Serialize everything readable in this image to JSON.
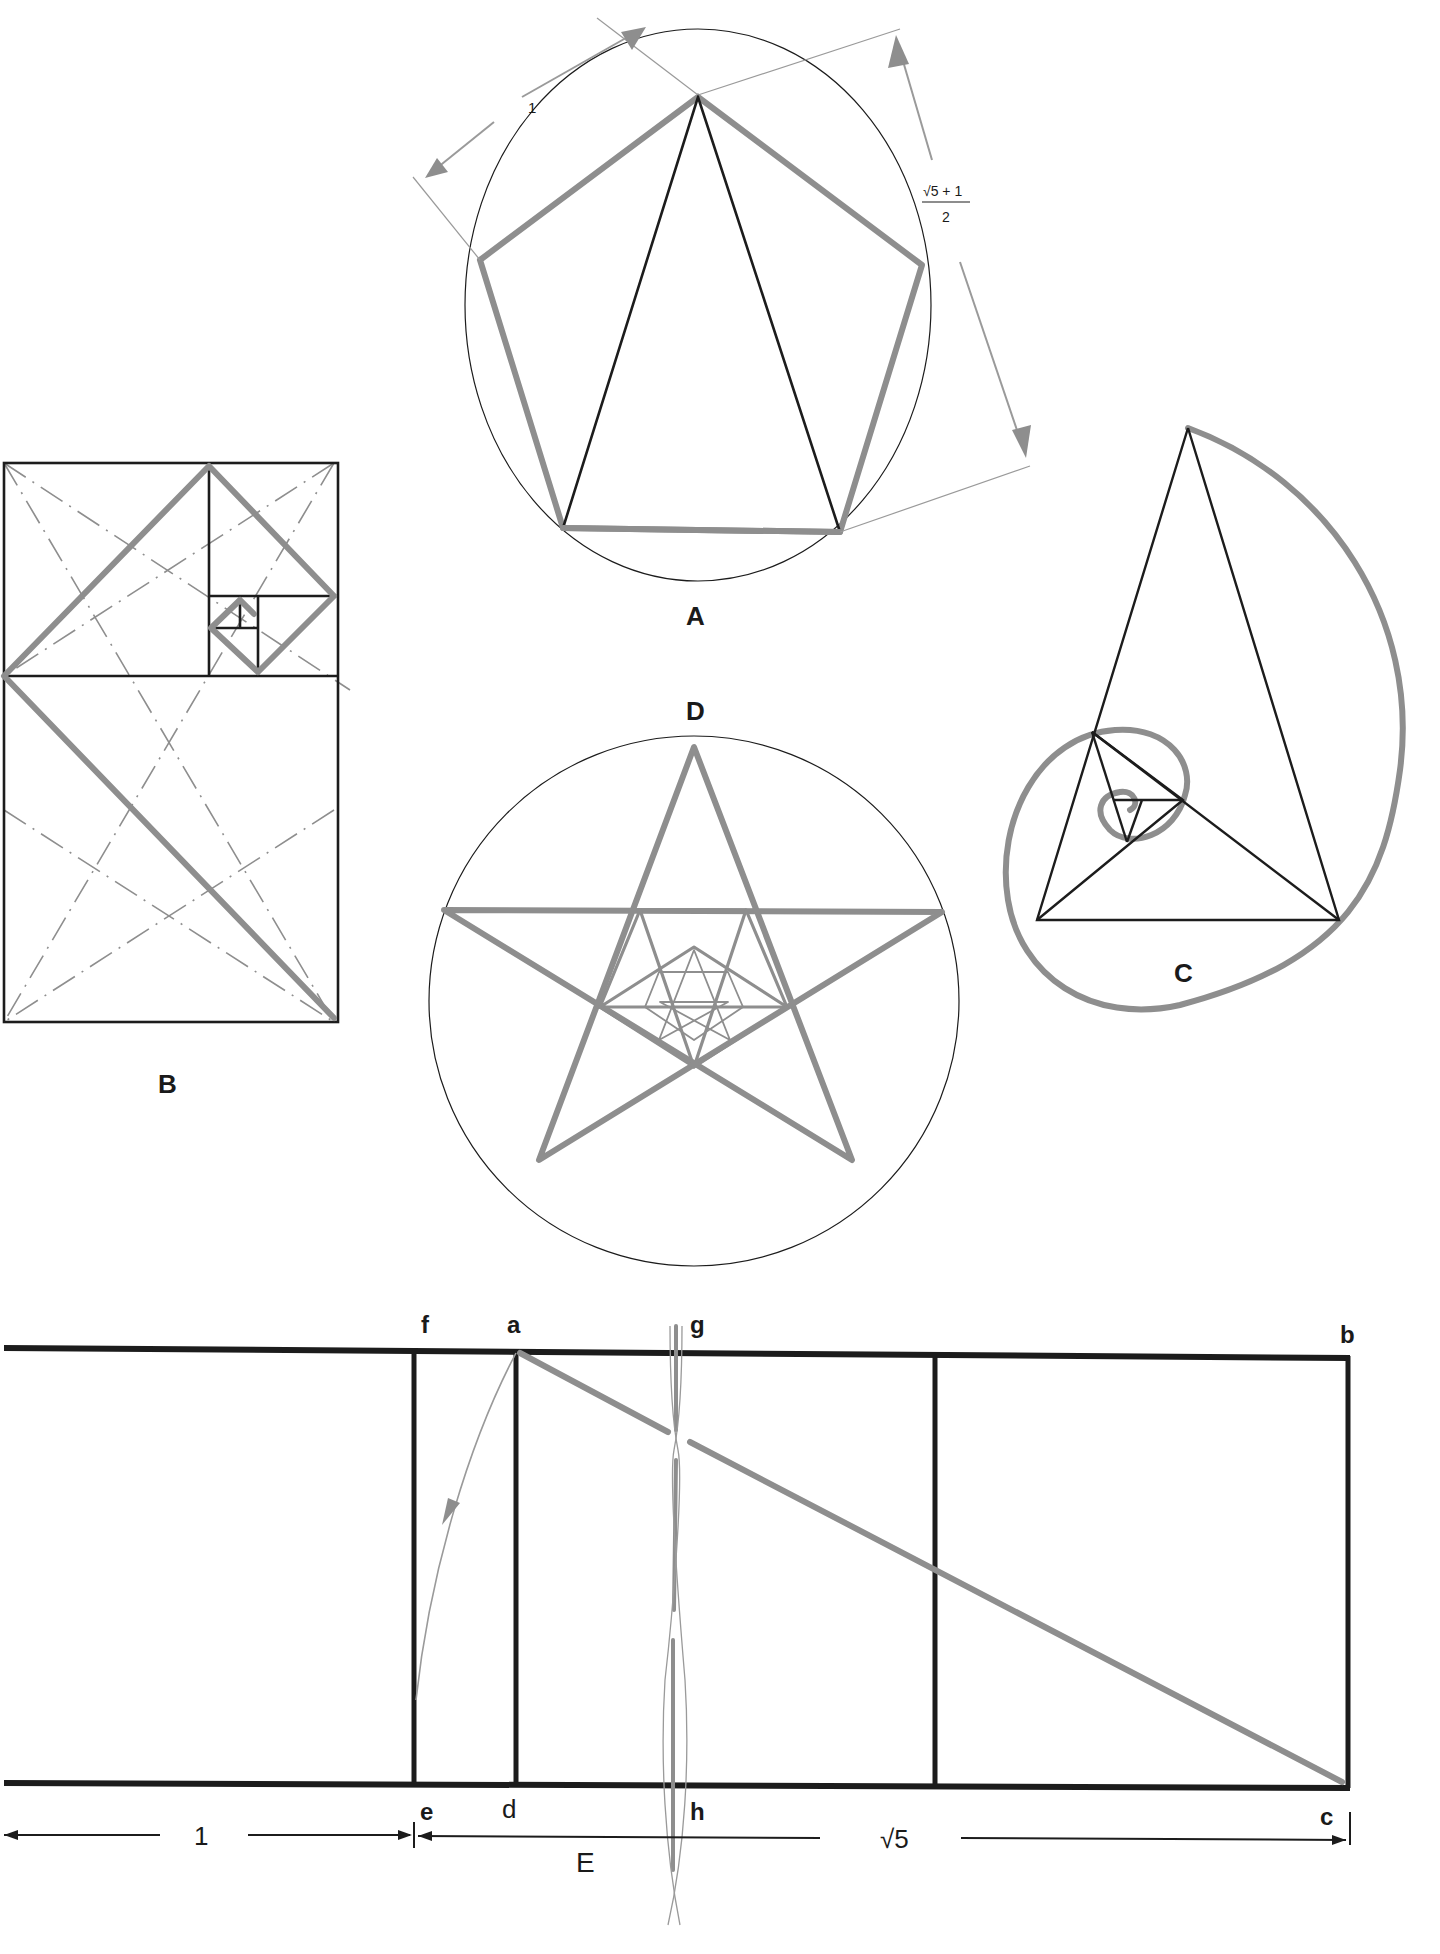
{
  "figure": {
    "panels": [
      {
        "id": "A",
        "label": "A",
        "description": "Regular pentagon inscribed in a circle with golden triangle; side ratio annotation",
        "dimension_side": "1",
        "dimension_diagonal": {
          "numerator": "√5 + 1",
          "denominator": "2"
        }
      },
      {
        "id": "B",
        "label": "B",
        "description": "Golden rectangle subdivided into squares with diagonals and dash-dot construction lines"
      },
      {
        "id": "C",
        "label": "C",
        "description": "Golden triangle with nested gnomons and logarithmic spiral"
      },
      {
        "id": "D",
        "label": "D",
        "description": "Nested pentagrams inscribed in a circle"
      },
      {
        "id": "E",
        "label": "E",
        "description": "Construction of golden rectangle from √5 rectangle",
        "points": {
          "f": "f",
          "a": "a",
          "g": "g",
          "b": "b",
          "e": "e",
          "d": "d",
          "h": "h",
          "c": "c"
        },
        "dimension_left": "1",
        "dimension_right": "√5"
      }
    ],
    "colors": {
      "black_line": "#1c1c1c",
      "gray_line": "#8e8e8e",
      "thin_line": "#9a9a9a",
      "background": "#ffffff"
    }
  }
}
